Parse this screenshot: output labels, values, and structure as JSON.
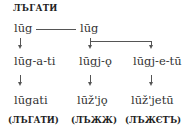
{
  "title": "ЛЪГАТИ",
  "nodes": {
    "root_left": "lūg",
    "root_right": "lūg",
    "mid_left": "lūg-a-ti",
    "mid_center": "lūgj-ǫ",
    "mid_right": "lūgj-e-tū",
    "out_left": "lūgati",
    "out_center": "lūž'jǫ",
    "out_right": "lūž'jetū"
  },
  "glosses": {
    "left": "(ЛЪГАТИ)",
    "center": "(ЛЪЖЖ)",
    "right": "(ЛЪЖЄТЪ)"
  }
}
